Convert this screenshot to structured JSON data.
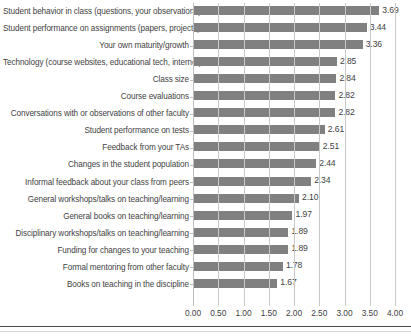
{
  "chart_data": {
    "type": "bar",
    "orientation": "horizontal",
    "title": "",
    "subtitle": "",
    "xlabel": "",
    "ylabel": "",
    "xlim": [
      0,
      4
    ],
    "xticks": [
      "0.00",
      "0.50",
      "1.00",
      "1.50",
      "2.00",
      "2.50",
      "3.00",
      "3.50",
      "4.00"
    ],
    "xtick_values": [
      0,
      0.5,
      1,
      1.5,
      2,
      2.5,
      3,
      3.5,
      4
    ],
    "grid": "vertical",
    "legend": "none",
    "bar_color": "#808080",
    "categories": [
      "Student behavior in class (questions, your observations)",
      "Student performance on assignments (papers, projects)",
      "Your own maturity/growth",
      "Technology (course websites, educational tech, internet)",
      "Class size",
      "Course evaluations",
      "Conversations with or observations of other faculty",
      "Student performance on tests",
      "Feedback from your TAs",
      "Changes in the student population",
      "Informal feedback about your class from  peers",
      "General workshops/talks on teaching/learning",
      "General books on teaching/learning",
      "Disciplinary workshops/talks on teaching/learning",
      "Funding for changes to your teaching",
      "Formal mentoring from other faculty",
      "Books on teaching in the discipline"
    ],
    "values": [
      3.69,
      3.44,
      3.36,
      2.85,
      2.84,
      2.82,
      2.82,
      2.61,
      2.51,
      2.44,
      2.34,
      2.1,
      1.97,
      1.89,
      1.89,
      1.78,
      1.67
    ],
    "value_labels": [
      "3.69",
      "3.44",
      "3.36",
      "2.85",
      "2.84",
      "2.82",
      "2.82",
      "2.61",
      "2.51",
      "2.44",
      "2.34",
      "2.10",
      "1.97",
      "1.89",
      "1.89",
      "1.78",
      "1.67"
    ]
  }
}
